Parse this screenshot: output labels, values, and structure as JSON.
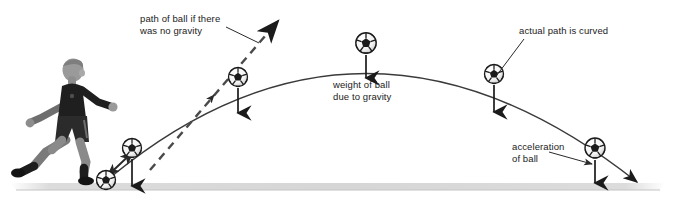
{
  "figure": {
    "background_color": "#ffffff",
    "ink_color": "#1b1b1b",
    "ground_color": "#d9d9d9"
  },
  "labels": {
    "no_gravity": "path of ball if there\nwas no gravity",
    "weight": "weight of ball\ndue to gravity",
    "actual_path": "actual path is curved",
    "acceleration": "acceleration\nof ball"
  },
  "icons": {
    "player": "soccer-player-icon",
    "ball": "soccer-ball-icon",
    "gravity_arrow": "down-arrow-icon",
    "velocity_arrow": "up-right-arrow-icon",
    "dashed_path": "dashed-straight-path-icon",
    "curved_path": "parabolic-path-icon",
    "ground": "ground-line-icon"
  },
  "scene": {
    "ground_y": 186,
    "player": {
      "x": 30,
      "y": 60,
      "w": 78,
      "h": 128
    },
    "balls": [
      {
        "name": "ball-at-kick",
        "cx": 106,
        "cy": 180,
        "r": 10,
        "gravity_arrow": false
      },
      {
        "name": "ball-rising-low",
        "cx": 132,
        "cy": 148,
        "r": 10,
        "gravity_arrow": true,
        "arrow_len": 38
      },
      {
        "name": "ball-rising-high",
        "cx": 238,
        "cy": 77,
        "r": 10,
        "gravity_arrow": true,
        "arrow_len": 34
      },
      {
        "name": "ball-apex",
        "cx": 366,
        "cy": 43,
        "r": 11,
        "gravity_arrow": true,
        "arrow_len": 35
      },
      {
        "name": "ball-descending",
        "cx": 494,
        "cy": 74,
        "r": 10,
        "gravity_arrow": true,
        "arrow_len": 38
      },
      {
        "name": "ball-near-ground",
        "cx": 595,
        "cy": 148,
        "r": 11,
        "gravity_arrow": true,
        "arrow_len": 34
      }
    ],
    "curved_path": {
      "start": [
        112,
        176
      ],
      "apex": [
        366,
        37
      ],
      "end": [
        637,
        186
      ]
    },
    "dashed_path": {
      "start": [
        150,
        168
      ],
      "end": [
        282,
        16
      ]
    },
    "leader_lines": [
      {
        "name": "leader-no-gravity",
        "from": [
          227,
          28
        ],
        "to": [
          258,
          42
        ]
      },
      {
        "name": "leader-actual-path",
        "from": [
          523,
          40
        ],
        "to": [
          497,
          76
        ]
      },
      {
        "name": "leader-acceleration",
        "from": [
          553,
          152
        ],
        "to": [
          592,
          163
        ]
      }
    ]
  }
}
